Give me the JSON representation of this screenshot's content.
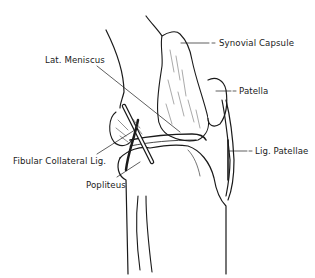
{
  "figure": {
    "labels": {
      "synovial_capsule": "Synovial Capsule",
      "patella": "Patella",
      "lat_meniscus": "Lat. Meniscus",
      "fibular_collateral": "Fibular Collateral Lig.",
      "popliteus": "Popliteus",
      "lig_patellae": "Lig. Patellae"
    },
    "colors": {
      "ink": "#1a1a1a",
      "background": "#ffffff"
    }
  }
}
